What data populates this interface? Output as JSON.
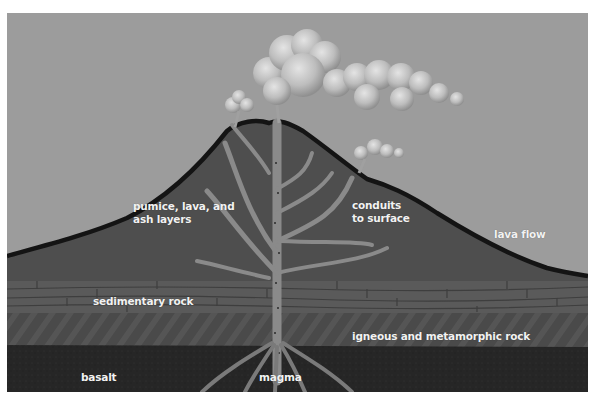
{
  "diagram": {
    "labels": {
      "pumice_line1": "pumice, lava, and",
      "pumice_line2": "ash layers",
      "conduits_line1": "conduits",
      "conduits_line2": "to surface",
      "lava_flow": "lava flow",
      "sedimentary_rock": "sedimentary rock",
      "igneous_metamorphic_rock": "igneous and metamorphic rock",
      "basalt": "basalt",
      "magma": "magma"
    },
    "colors": {
      "sky": "#9c9c9c",
      "volcano_body": "#4e4e4e",
      "volcano_outline": "#141414",
      "conduit": "#8a8a8a",
      "sedimentary": "#5a5a5a",
      "igneous": "#4a4a4a",
      "basalt": "#262626",
      "cloud": "#c8c8c8",
      "label_text": "#f2f2f2"
    }
  }
}
